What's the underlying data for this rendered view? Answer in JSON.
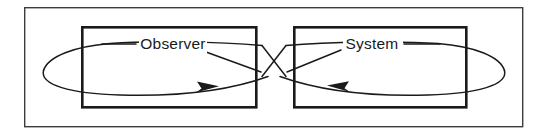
{
  "figure": {
    "type": "block-diagram",
    "background_color": "#ffffff",
    "line_color": "#1a1a1a",
    "frame_color": "#3c3c3c",
    "canvas": {
      "width": 546,
      "height": 136
    }
  },
  "frame": {
    "name": "outer-frame",
    "x": 24,
    "y": 7,
    "width": 499,
    "height": 120
  },
  "nodes": [
    {
      "id": "observer",
      "label": "Observer",
      "x": 81,
      "y": 26,
      "width": 176,
      "height": 82,
      "label_x": 174,
      "label_y": 44
    },
    {
      "id": "system",
      "label": "System",
      "x": 293,
      "y": 26,
      "width": 174,
      "height": 82,
      "label_x": 371,
      "label_y": 44
    }
  ],
  "connections": [
    {
      "id": "observer-to-system",
      "from": "observer",
      "to": "system",
      "direction": "left-to-right",
      "arrow_x": 214,
      "arrow_y": 87,
      "description": "Lower curve sweeping right with arrowhead pointing right"
    },
    {
      "id": "system-to-observer",
      "from": "system",
      "to": "observer",
      "direction": "right-to-left",
      "arrow_x": 333,
      "arrow_y": 86,
      "description": "Lower curve sweeping left with arrowhead pointing left"
    }
  ],
  "crossing_point": {
    "x": 273,
    "y": 73
  },
  "leaders": [
    {
      "id": "observer-leader-left",
      "from_x": 102,
      "from_y": 44,
      "to_x": 136,
      "to_y": 44
    },
    {
      "id": "observer-leader-right",
      "from_x": 206,
      "from_y": 52,
      "to_x": 262,
      "to_y": 72
    },
    {
      "id": "system-leader-left",
      "from_x": 286,
      "from_y": 72,
      "to_x": 341,
      "to_y": 50
    },
    {
      "id": "system-leader-right",
      "from_x": 404,
      "from_y": 44,
      "to_x": 440,
      "to_y": 44
    }
  ]
}
